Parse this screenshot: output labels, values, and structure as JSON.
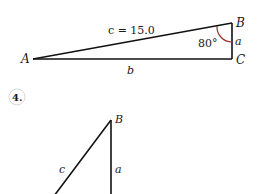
{
  "figure_top": {
    "vertices": {
      "A": "A",
      "B": "B",
      "C": "C"
    },
    "sides": {
      "hypotenuse": "c = 15.0",
      "vertical": "a",
      "base": "b"
    },
    "angle_label": "80°",
    "colors": {
      "line": "#111111",
      "arc": "#9b2d2d"
    }
  },
  "problem_number": "4.",
  "figure_bottom": {
    "vertices": {
      "B": "B"
    },
    "sides": {
      "hypotenuse": "c",
      "vertical": "a"
    }
  }
}
